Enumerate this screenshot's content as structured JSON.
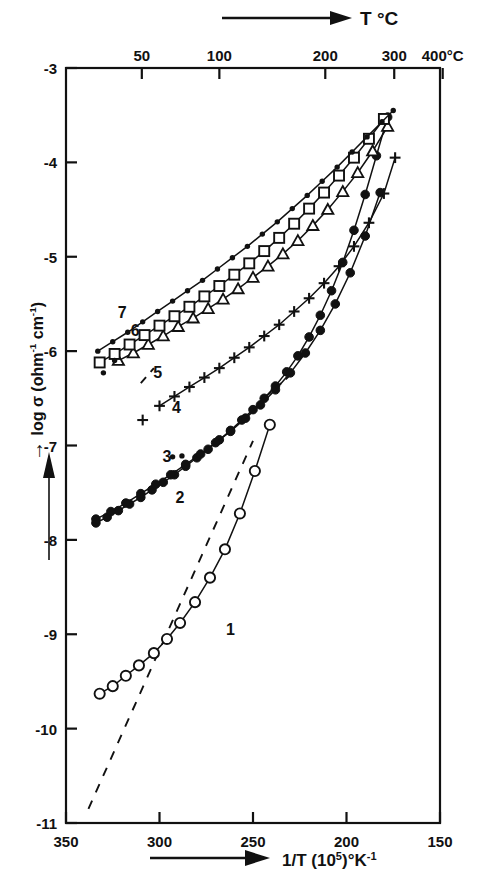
{
  "chart_data": {
    "type": "line",
    "title": "",
    "xlabel": "1/T (10^5)°K^-1",
    "xlabel_parts": {
      "pre": "1/T (10",
      "sup1": "5",
      "mid": ")°K",
      "sup2": "-1"
    },
    "ylabel": "log σ (ohm^-1 cm^-1)",
    "ylabel_parts": {
      "pre": "log σ (ohm",
      "sup1": "-1",
      "mid": " cm",
      "sup2": "-1",
      "post": ")"
    },
    "top_axis_label": "T °C",
    "xlim": [
      350,
      150
    ],
    "ylim": [
      -11,
      -3
    ],
    "x_ticks": [
      "350",
      "300",
      "250",
      "200",
      "150"
    ],
    "x_tick_values": [
      350,
      300,
      250,
      200,
      150
    ],
    "y_ticks": [
      "-3",
      "-4",
      "-5",
      "-6",
      "-7",
      "-8",
      "-9",
      "-10",
      "-11"
    ],
    "y_tick_values": [
      -3,
      -4,
      -5,
      -6,
      -7,
      -8,
      -9,
      -10,
      -11
    ],
    "top_ticks": [
      "50",
      "100",
      "200",
      "300",
      "400°C"
    ],
    "top_tick_values": [
      50,
      100,
      200,
      300,
      400
    ],
    "grid": false,
    "legend": "inline curve numbers 1-7",
    "series": [
      {
        "name": "1",
        "label": "1",
        "marker": "open-circle",
        "x": [
          332,
          325,
          318,
          311,
          303,
          296,
          289,
          281,
          273,
          265,
          257,
          249,
          241
        ],
        "y": [
          -9.63,
          -9.55,
          -9.44,
          -9.33,
          -9.2,
          -9.05,
          -8.88,
          -8.66,
          -8.4,
          -8.1,
          -7.72,
          -7.27,
          -6.78
        ],
        "dashed_extension": {
          "x": [
            338,
            250
          ],
          "y": [
            -10.85,
            -6.95
          ]
        }
      },
      {
        "name": "2",
        "label": "2",
        "marker": "filled-circle",
        "x": [
          334,
          328,
          322,
          316,
          310,
          304,
          298,
          292,
          286,
          280,
          274,
          268,
          262,
          256,
          250,
          244,
          238,
          232,
          226,
          220,
          214,
          208,
          202,
          196,
          190,
          184,
          178
        ],
        "y": [
          -7.82,
          -7.76,
          -7.69,
          -7.62,
          -7.55,
          -7.47,
          -7.39,
          -7.31,
          -7.22,
          -7.13,
          -7.04,
          -6.94,
          -6.84,
          -6.73,
          -6.62,
          -6.5,
          -6.37,
          -6.22,
          -6.05,
          -5.85,
          -5.62,
          -5.36,
          -5.06,
          -4.72,
          -4.34,
          -3.93,
          -3.52
        ]
      },
      {
        "name": "3",
        "label": "3",
        "marker": "filled-circle",
        "x": [
          334,
          326,
          318,
          310,
          302,
          294,
          286,
          278,
          270,
          262,
          254,
          246,
          238,
          230,
          222,
          214,
          206,
          198,
          190,
          182
        ],
        "y": [
          -7.78,
          -7.7,
          -7.61,
          -7.51,
          -7.41,
          -7.31,
          -7.2,
          -7.09,
          -6.97,
          -6.85,
          -6.71,
          -6.57,
          -6.41,
          -6.23,
          -6.02,
          -5.78,
          -5.5,
          -5.17,
          -4.78,
          -4.32
        ]
      },
      {
        "name": "4",
        "label": "4",
        "marker": "plus",
        "x": [
          300,
          292,
          284,
          276,
          268,
          260,
          252,
          244,
          236,
          228,
          220,
          212,
          204,
          196,
          188,
          180,
          174
        ],
        "y": [
          -6.58,
          -6.48,
          -6.38,
          -6.28,
          -6.18,
          -6.07,
          -5.96,
          -5.84,
          -5.72,
          -5.58,
          -5.44,
          -5.28,
          -5.1,
          -4.89,
          -4.64,
          -4.33,
          -3.95
        ]
      },
      {
        "name": "5",
        "label": "5",
        "marker": "open-triangle",
        "x": [
          322,
          314,
          306,
          298,
          290,
          282,
          274,
          266,
          258,
          250,
          242,
          234,
          226,
          218,
          210,
          202,
          194,
          186,
          178
        ],
        "y": [
          -6.1,
          -6.02,
          -5.93,
          -5.84,
          -5.74,
          -5.65,
          -5.55,
          -5.45,
          -5.34,
          -5.22,
          -5.1,
          -4.97,
          -4.83,
          -4.67,
          -4.5,
          -4.31,
          -4.11,
          -3.88,
          -3.62
        ]
      },
      {
        "name": "6",
        "label": "6",
        "marker": "open-square",
        "x": [
          332,
          324,
          316,
          308,
          300,
          292,
          284,
          276,
          268,
          260,
          252,
          244,
          236,
          228,
          220,
          212,
          204,
          196,
          188,
          180
        ],
        "y": [
          -6.12,
          -6.03,
          -5.93,
          -5.83,
          -5.73,
          -5.63,
          -5.53,
          -5.42,
          -5.31,
          -5.19,
          -5.07,
          -4.94,
          -4.8,
          -4.65,
          -4.49,
          -4.32,
          -4.14,
          -3.95,
          -3.75,
          -3.54
        ]
      },
      {
        "name": "7",
        "label": "7",
        "marker": "small-filled-dot",
        "x": [
          333,
          325,
          317,
          309,
          301,
          293,
          285,
          277,
          269,
          261,
          253,
          245,
          237,
          229,
          221,
          213,
          205,
          197,
          189,
          181,
          175
        ],
        "y": [
          -6.0,
          -5.9,
          -5.8,
          -5.69,
          -5.58,
          -5.47,
          -5.36,
          -5.25,
          -5.13,
          -5.01,
          -4.89,
          -4.76,
          -4.63,
          -4.49,
          -4.35,
          -4.2,
          -4.05,
          -3.89,
          -3.73,
          -3.57,
          -3.45
        ]
      }
    ],
    "annotations": [
      {
        "name": "curve-label-1",
        "text": "1",
        "x": 262,
        "y": -9.01
      },
      {
        "name": "curve-label-2",
        "text": "2",
        "x": 289,
        "y": -7.61
      },
      {
        "name": "curve-label-3",
        "text": "3",
        "x": 296,
        "y": -7.18
      },
      {
        "name": "curve-label-4",
        "text": "4",
        "x": 291,
        "y": -6.66
      },
      {
        "name": "curve-label-5",
        "text": "5",
        "x": 301,
        "y": -6.29
      },
      {
        "name": "curve-label-6",
        "text": "6",
        "x": 313,
        "y": -5.84
      },
      {
        "name": "curve-label-7",
        "text": "7",
        "x": 320,
        "y": -5.65
      }
    ],
    "stray_points": [
      {
        "x": 330,
        "y": -6.23,
        "marker": "small-filled-dot"
      },
      {
        "x": 324,
        "y": -6.1,
        "marker": "small-filled-dot"
      },
      {
        "x": 309,
        "y": -6.73,
        "marker": "plus"
      },
      {
        "x": 293,
        "y": -7.12,
        "marker": "small-filled-dot"
      },
      {
        "x": 288,
        "y": -7.11,
        "marker": "small-filled-dot"
      }
    ]
  }
}
